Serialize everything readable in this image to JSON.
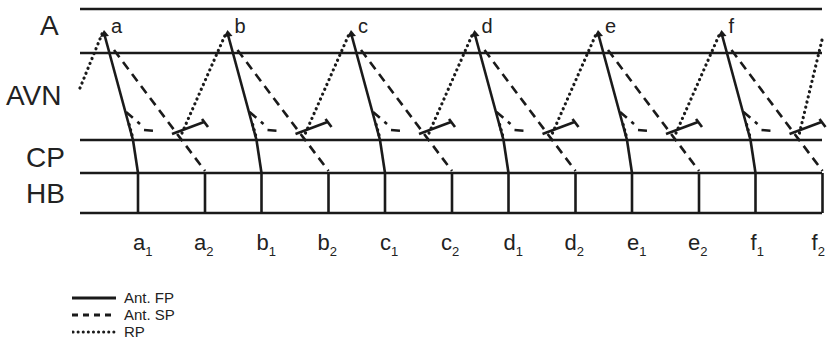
{
  "diagram": {
    "type": "laddergram",
    "levels": [
      {
        "id": "A",
        "label": "A"
      },
      {
        "id": "AVN",
        "label": "AVN"
      },
      {
        "id": "CP",
        "label": "CP"
      },
      {
        "id": "HB",
        "label": "HB"
      }
    ],
    "atrial_events": [
      "a",
      "b",
      "c",
      "d",
      "e",
      "f"
    ],
    "his_events": [
      {
        "base": "a",
        "sub": "1"
      },
      {
        "base": "a",
        "sub": "2"
      },
      {
        "base": "b",
        "sub": "1"
      },
      {
        "base": "b",
        "sub": "2"
      },
      {
        "base": "c",
        "sub": "1"
      },
      {
        "base": "c",
        "sub": "2"
      },
      {
        "base": "d",
        "sub": "1"
      },
      {
        "base": "d",
        "sub": "2"
      },
      {
        "base": "e",
        "sub": "1"
      },
      {
        "base": "e",
        "sub": "2"
      },
      {
        "base": "f",
        "sub": "1"
      },
      {
        "base": "f",
        "sub": "2"
      }
    ],
    "legend": [
      {
        "style": "solid",
        "label": "Ant. FP"
      },
      {
        "style": "dashed",
        "label": "Ant. SP"
      },
      {
        "style": "dotted",
        "label": "RP"
      }
    ],
    "line_color": "#1a1a1a"
  }
}
